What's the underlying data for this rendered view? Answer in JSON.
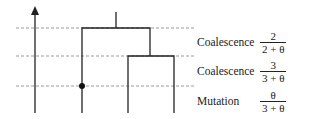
{
  "diagram": {
    "type": "coalescent-tree",
    "events": [
      {
        "label": "Coalescence",
        "numerator": "2",
        "denominator": "2 + θ"
      },
      {
        "label": "Coalescence",
        "numerator": "3",
        "denominator": "3 + θ"
      },
      {
        "label": "Mutation",
        "numerator": "θ",
        "denominator": "3 + θ"
      }
    ]
  }
}
